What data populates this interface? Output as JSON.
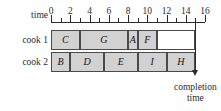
{
  "axis": {
    "label": "time",
    "min": 0,
    "max": 16,
    "major_ticks": [
      0,
      2,
      4,
      6,
      8,
      10,
      12,
      14,
      16
    ],
    "minor_ticks": [
      1,
      3,
      5,
      7,
      9,
      11,
      13,
      15
    ],
    "tick_labels": [
      "0",
      "2",
      "4",
      "6",
      "8",
      "10",
      "12",
      "14",
      "16"
    ]
  },
  "rows": [
    {
      "label": "cook 1"
    },
    {
      "label": "cook 2"
    }
  ],
  "annotation": {
    "completion_line1": "completion",
    "completion_line2": "time",
    "completion_value": 15
  },
  "colors": {
    "segment_fill": "#d2d2d2",
    "segment_border": "#4a4a4a",
    "empty_fill": "#ffffff",
    "axis": "#2b2b2b",
    "text": "#1a1a1a"
  },
  "chart_data": {
    "type": "bar",
    "title": "",
    "xlabel": "time",
    "ylabel": "",
    "xlim": [
      0,
      16
    ],
    "grid": false,
    "legend": "none",
    "orientation": "horizontal-gantt",
    "categories": [
      "cook 1",
      "cook 2"
    ],
    "series": [
      {
        "name": "cook 1",
        "tasks": [
          {
            "label": "C",
            "start": 0,
            "end": 3,
            "duration": 3,
            "filled": true
          },
          {
            "label": "G",
            "start": 3,
            "end": 8,
            "duration": 5,
            "filled": true
          },
          {
            "label": "A",
            "start": 8,
            "end": 9,
            "duration": 1,
            "filled": true
          },
          {
            "label": "F",
            "start": 9,
            "end": 11,
            "duration": 2,
            "filled": true
          },
          {
            "label": "",
            "start": 11,
            "end": 15,
            "duration": 4,
            "filled": false
          }
        ]
      },
      {
        "name": "cook 2",
        "tasks": [
          {
            "label": "B",
            "start": 0,
            "end": 2,
            "duration": 2,
            "filled": true
          },
          {
            "label": "D",
            "start": 2,
            "end": 5.5,
            "duration": 3.5,
            "filled": true
          },
          {
            "label": "E",
            "start": 5.5,
            "end": 9,
            "duration": 3.5,
            "filled": true
          },
          {
            "label": "I",
            "start": 9,
            "end": 12,
            "duration": 3,
            "filled": true
          },
          {
            "label": "H",
            "start": 12,
            "end": 15,
            "duration": 3,
            "filled": true
          }
        ]
      }
    ]
  }
}
